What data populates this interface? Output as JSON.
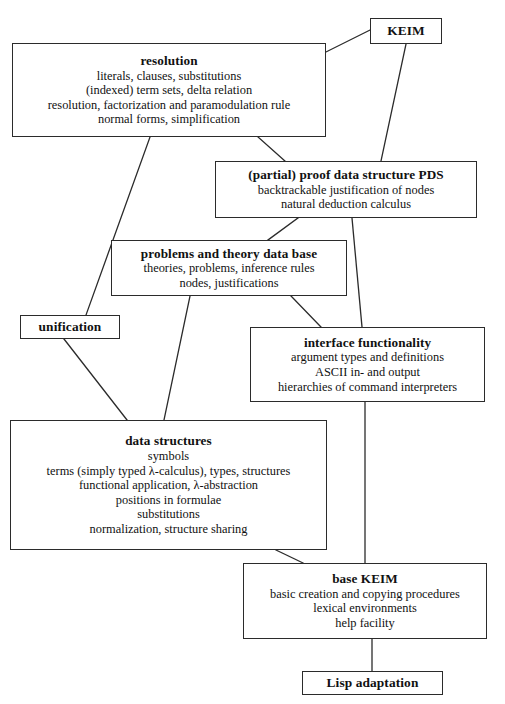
{
  "diagram": {
    "line_color": "#2b2b2b",
    "background": "#ffffff",
    "nodes": {
      "keim": {
        "title": "KEIM",
        "lines": []
      },
      "resolution": {
        "title": "resolution",
        "lines": [
          "literals, clauses, substitutions",
          "(indexed) term sets, delta relation",
          "resolution, factorization and paramodulation rule",
          "normal forms, simplification"
        ]
      },
      "pds": {
        "title": "(partial) proof data structure PDS",
        "lines": [
          "backtrackable justification of nodes",
          "natural deduction calculus"
        ]
      },
      "problems": {
        "title": "problems and theory data base",
        "lines": [
          "theories, problems, inference rules",
          "nodes, justifications"
        ]
      },
      "unification": {
        "title": "unification",
        "lines": []
      },
      "interface": {
        "title": "interface functionality",
        "lines": [
          "argument types and definitions",
          "ASCII in- and output",
          "hierarchies of command interpreters"
        ]
      },
      "datastructures": {
        "title": "data structures",
        "lines": [
          "symbols",
          "terms (simply typed λ-calculus), types, structures",
          "functional application, λ-abstraction",
          "positions in formulae",
          "substitutions",
          "normalization, structure sharing"
        ]
      },
      "basekeim": {
        "title": "base KEIM",
        "lines": [
          "basic creation and copying procedures",
          "lexical environments",
          "help facility"
        ]
      },
      "lisp": {
        "title": "Lisp adaptation",
        "lines": []
      }
    },
    "edges": [
      {
        "from": "keim",
        "to": "resolution"
      },
      {
        "from": "keim",
        "to": "pds"
      },
      {
        "from": "resolution",
        "to": "pds"
      },
      {
        "from": "resolution",
        "to": "unification"
      },
      {
        "from": "pds",
        "to": "problems"
      },
      {
        "from": "pds",
        "to": "interface"
      },
      {
        "from": "problems",
        "to": "interface"
      },
      {
        "from": "problems",
        "to": "datastructures"
      },
      {
        "from": "unification",
        "to": "datastructures"
      },
      {
        "from": "interface",
        "to": "basekeim"
      },
      {
        "from": "datastructures",
        "to": "basekeim"
      },
      {
        "from": "basekeim",
        "to": "lisp"
      }
    ]
  }
}
